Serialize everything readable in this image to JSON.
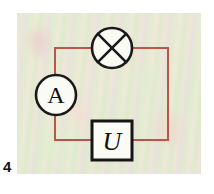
{
  "figure": {
    "number_label": "4",
    "caption": "",
    "panel": {
      "background_color": "#e6eed6",
      "texture": "mottled-green-pink-paper"
    }
  },
  "circuit": {
    "wire_color": "#b8564c",
    "wire_width_px": 2,
    "symbol_stroke_color": "#1a1a1a",
    "components": [
      {
        "id": "lamp",
        "data_name": "lamp-symbol",
        "symbol": "circle-with-x",
        "label": "",
        "cx": 112,
        "cy": 48,
        "r": 20
      },
      {
        "id": "ammeter",
        "data_name": "ammeter-symbol",
        "symbol": "circle-with-letter",
        "label": "A",
        "cx": 56,
        "cy": 95,
        "r": 20
      },
      {
        "id": "voltmeter",
        "data_name": "voltmeter-symbol",
        "symbol": "box-with-letter",
        "label": "U",
        "x": 92,
        "y": 121,
        "width": 40,
        "height": 39
      }
    ],
    "nodes": {
      "top_left": [
        55,
        48
      ],
      "top_right": [
        168,
        48
      ],
      "bottom_left": [
        55,
        140
      ],
      "bottom_right": [
        168,
        140
      ]
    },
    "wire_segments": [
      {
        "name": "top-left-wire",
        "from": [
          55,
          48
        ],
        "to": [
          92,
          48
        ]
      },
      {
        "name": "top-right-wire",
        "from": [
          132,
          48
        ],
        "to": [
          168,
          48
        ]
      },
      {
        "name": "left-upper-wire",
        "from": [
          55,
          48
        ],
        "to": [
          55,
          75
        ]
      },
      {
        "name": "left-lower-wire",
        "from": [
          55,
          115
        ],
        "to": [
          55,
          140
        ]
      },
      {
        "name": "right-wire",
        "from": [
          168,
          48
        ],
        "to": [
          168,
          140
        ]
      },
      {
        "name": "bottom-left-wire",
        "from": [
          55,
          140
        ],
        "to": [
          92,
          140
        ]
      },
      {
        "name": "bottom-right-wire",
        "from": [
          132,
          140
        ],
        "to": [
          168,
          140
        ]
      }
    ]
  }
}
